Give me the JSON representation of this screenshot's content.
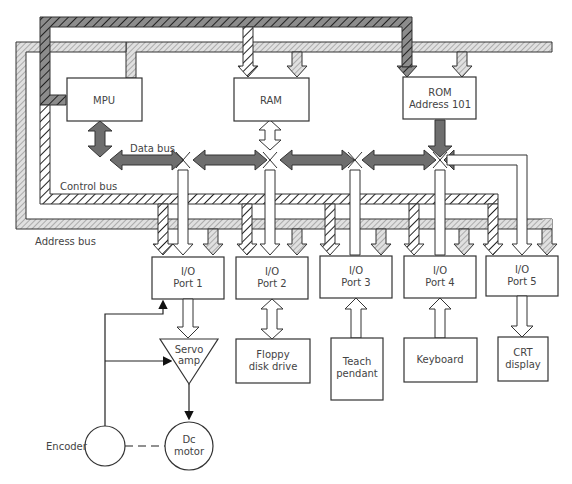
{
  "diagram": {
    "blocks": {
      "mpu": "MPU",
      "ram": "RAM",
      "rom_line1": "ROM",
      "rom_line2": "Address 101",
      "io1_line1": "I/O",
      "io1_line2": "Port 1",
      "io2_line1": "I/O",
      "io2_line2": "Port 2",
      "io3_line1": "I/O",
      "io3_line2": "Port 3",
      "io4_line1": "I/O",
      "io4_line2": "Port 4",
      "io5_line1": "I/O",
      "io5_line2": "Port 5",
      "servo_line1": "Servo",
      "servo_line2": "amp",
      "motor_line1": "Dc",
      "motor_line2": "motor",
      "encoder": "Encoder",
      "floppy_line1": "Floppy",
      "floppy_line2": "disk drive",
      "teach_line1": "Teach",
      "teach_line2": "pendant",
      "keyboard": "Keyboard",
      "crt_line1": "CRT",
      "crt_line2": "display"
    },
    "buses": {
      "data": "Data bus",
      "control": "Control bus",
      "address": "Address bus"
    },
    "colors": {
      "data_bus": "#6e6e6e",
      "control_bus_dark": "#8a8a8a",
      "address_bus": "#c8c8c8",
      "line": "#222222"
    }
  }
}
